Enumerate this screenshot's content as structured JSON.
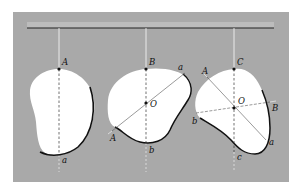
{
  "figure": {
    "background_color": "#a9a9a9",
    "body_fill": "#ffffff",
    "outline_color": "#111111",
    "string_color": "#f2f2f2",
    "support_bar": {
      "x1": 27,
      "x2": 274,
      "y": 28
    },
    "bodies": [
      {
        "name": "body-1",
        "suspension_point_label": "A",
        "bottom_label": "a",
        "string_x": 59
      },
      {
        "name": "body-2",
        "suspension_point_label": "B",
        "center_label": "O",
        "line_labels": [
          "A",
          "a",
          "b"
        ],
        "string_x": 146
      },
      {
        "name": "body-3",
        "suspension_point_label": "C",
        "center_label": "O",
        "line_labels": [
          "A",
          "a",
          "B",
          "b",
          "c"
        ],
        "string_x": 234
      }
    ]
  },
  "labels": {
    "b1_A": "A",
    "b1_a": "a",
    "b2_B": "B",
    "b2_a": "a",
    "b2_O": "O",
    "b2_A": "A",
    "b2_b": "b",
    "b3_C": "C",
    "b3_A": "A",
    "b3_O": "O",
    "b3_B": "B",
    "b3_b": "b",
    "b3_a": "a",
    "b3_c": "c"
  }
}
